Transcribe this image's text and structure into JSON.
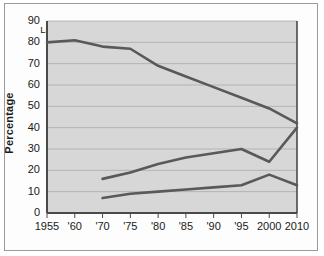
{
  "chart_data": {
    "type": "line",
    "title": "",
    "xlabel": "",
    "ylabel": "Percentage",
    "ylim": [
      0,
      90
    ],
    "ytick_values": [
      90,
      80,
      70,
      60,
      50,
      40,
      30,
      20,
      10,
      0
    ],
    "ytick_labels": [
      "90",
      "80",
      "70",
      "60",
      "50",
      "40",
      "30",
      "20",
      "10",
      "0"
    ],
    "x": [
      1955,
      1960,
      1970,
      1975,
      1980,
      1985,
      1990,
      1995,
      2000,
      2010
    ],
    "xtick_labels": [
      "1955",
      "'60",
      "'70",
      "'75",
      "'80",
      "'85",
      "'90",
      "'95",
      "2000",
      "2010"
    ],
    "grid": true,
    "legend_position": "inline-annotations",
    "line_color": "#595959",
    "plot_background": "#d7d7d7",
    "gridline_color": "#a9a9a9",
    "axis_color": "#4a4a4a",
    "series": [
      {
        "name": "Living with children",
        "x": [
          1955,
          1960,
          1970,
          1975,
          1980,
          1985,
          1990,
          1995,
          2000,
          2010
        ],
        "values": [
          80,
          81,
          78,
          77,
          69,
          64,
          59,
          54,
          49,
          42
        ],
        "label": "Living with children"
      },
      {
        "name": "Living only with spouse",
        "x": [
          1970,
          1975,
          1980,
          1985,
          1990,
          1995,
          2000,
          2010
        ],
        "values": [
          16,
          19,
          23,
          26,
          28,
          30,
          24,
          40
        ],
        "label": "Living only with spouse"
      },
      {
        "name": "Living alone",
        "x": [
          1970,
          1975,
          1980,
          1985,
          1990,
          1995,
          2000,
          2010
        ],
        "values": [
          7,
          9,
          10,
          11,
          12,
          13,
          18,
          13
        ],
        "label": "Living alone"
      }
    ],
    "annotations": [
      {
        "text": "Living with children",
        "x": 1962,
        "y": 86
      },
      {
        "text": "Living only with spouse",
        "x": 1988,
        "y": 34
      },
      {
        "text": "Living alone",
        "x": 1990,
        "y": 17
      }
    ]
  }
}
